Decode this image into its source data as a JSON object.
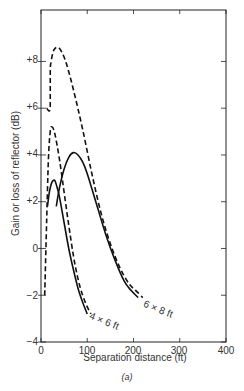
{
  "chart_data": {
    "type": "line",
    "title": "",
    "caption": "(a)",
    "xlabel": "Separation distance (ft)",
    "ylabel": "Gain or loss of reflector (dB)",
    "xlim": [
      0,
      400
    ],
    "ylim": [
      -4,
      10.2
    ],
    "xticks": [
      0,
      100,
      200,
      300,
      400
    ],
    "xtick_labels": [
      "0",
      "100",
      "200",
      "300",
      "400"
    ],
    "yticks": [
      -4,
      -2,
      0,
      2,
      4,
      6,
      8
    ],
    "ytick_labels": [
      "−4",
      "−2",
      "0",
      "+2",
      "+4",
      "+6",
      "+8"
    ],
    "grid": false,
    "legend": "none (curves annotated directly)",
    "series": [
      {
        "name": "4 x 6 ft (dashed)",
        "style": "dashed",
        "x": [
          8,
          12,
          16,
          20,
          24,
          30,
          40,
          50,
          60,
          70,
          80,
          90,
          100,
          108
        ],
        "y": [
          -2.0,
          1.0,
          3.8,
          5.0,
          5.2,
          4.9,
          3.8,
          2.4,
          1.0,
          -0.3,
          -1.3,
          -2.0,
          -2.5,
          -2.8
        ]
      },
      {
        "name": "4 x 6 ft (solid)",
        "style": "solid",
        "x": [
          14,
          18,
          22,
          26,
          30,
          35,
          40,
          50,
          60,
          70,
          80,
          90,
          100
        ],
        "y": [
          1.8,
          2.4,
          2.75,
          2.9,
          2.9,
          2.6,
          2.2,
          1.1,
          0.0,
          -0.9,
          -1.7,
          -2.3,
          -2.8
        ]
      },
      {
        "name": "6 x 8 ft (dashed)",
        "style": "dashed",
        "x": [
          12,
          20,
          20,
          22,
          26,
          30,
          37,
          45,
          55,
          70,
          90,
          110,
          130,
          150,
          170,
          190,
          205,
          220
        ],
        "y": [
          6.0,
          6.0,
          7.6,
          8.0,
          8.4,
          8.55,
          8.6,
          8.4,
          7.9,
          6.8,
          5.1,
          3.2,
          1.5,
          0.2,
          -0.8,
          -1.5,
          -1.8,
          -2.1
        ]
      },
      {
        "name": "6 x 8 ft (solid)",
        "style": "solid",
        "x": [
          33,
          40,
          50,
          60,
          70,
          80,
          90,
          100,
          120,
          140,
          160,
          180,
          195,
          210
        ],
        "y": [
          1.8,
          2.6,
          3.4,
          3.9,
          4.1,
          4.0,
          3.7,
          3.2,
          1.9,
          0.6,
          -0.5,
          -1.4,
          -1.8,
          -2.1
        ]
      }
    ],
    "annotations": [
      {
        "text": "4 × 6 ft",
        "x": 105,
        "y": -3.0
      },
      {
        "text": "6 × 8 ft",
        "x": 215,
        "y": -2.2
      }
    ]
  },
  "labels": {
    "xlabel": "Separation distance (ft)",
    "ylabel": "Gain or loss of reflector (dB)",
    "caption": "(a)",
    "ann_4x6": "4 × 6 ft",
    "ann_6x8": "6 × 8 ft",
    "xticks": [
      "0",
      "100",
      "200",
      "300",
      "400"
    ],
    "yticks": [
      "+8",
      "+6",
      "+4",
      "+2",
      "0",
      "−2",
      "−4"
    ]
  }
}
